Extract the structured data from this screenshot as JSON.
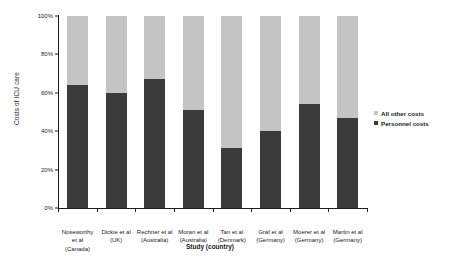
{
  "chart_data": {
    "type": "bar",
    "subtype": "stacked-percentage-column",
    "title": "",
    "xlabel": "Study (country)",
    "ylabel": "Costs of ICU care",
    "ylim": [
      0,
      100
    ],
    "ytick_labels": [
      "0%",
      "20%",
      "40%",
      "60%",
      "80%",
      "100%"
    ],
    "ytick_values": [
      0,
      20,
      40,
      60,
      80,
      100
    ],
    "grid": false,
    "legend_position": "right",
    "categories": [
      "Noseworthy et al (Canada)",
      "Dickie et al (UK)",
      "Rechner et al (Australia)",
      "Moran et al (Australia)",
      "Tan et al (Denmark)",
      "Graf et al (Germany)",
      "Moerer et al (Germany)",
      "Martin et al (Germany)"
    ],
    "category_lines": [
      [
        "Noseworthy",
        "et al",
        "(Canada)"
      ],
      [
        "Dickie et al",
        "(UK)"
      ],
      [
        "Rechner et al",
        "(Australia)"
      ],
      [
        "Moran et al",
        "(Australia)"
      ],
      [
        "Tan et al",
        "(Denmark)"
      ],
      [
        "Graf et al",
        "(Germany)"
      ],
      [
        "Moerer et al",
        "(Germany)"
      ],
      [
        "Martin et al",
        "(Germany)"
      ]
    ],
    "series": [
      {
        "name": "Personnel costs",
        "color": "#3b3b3b",
        "values": [
          64,
          60,
          67,
          51,
          31,
          40,
          54,
          47
        ]
      },
      {
        "name": "All other costs",
        "color": "#c4c4c4",
        "values": [
          36,
          40,
          33,
          49,
          69,
          60,
          46,
          53
        ]
      }
    ]
  },
  "legend": {
    "entries": [
      {
        "label": "All other costs",
        "color": "#c4c4c4"
      },
      {
        "label": "Personnel costs",
        "color": "#3b3b3b"
      }
    ]
  }
}
